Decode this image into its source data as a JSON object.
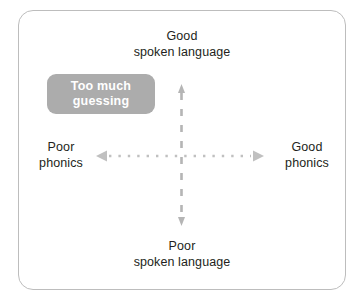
{
  "diagram": {
    "type": "quadrant-axes",
    "frame": {
      "border_color": "#bdbdbd",
      "background": "#ffffff",
      "corner_radius_px": 15
    },
    "axes": {
      "vertical": {
        "name": "spoken-language-axis",
        "top_label_line1": "Good",
        "top_label_line2": "spoken language",
        "bottom_label_line1": "Poor",
        "bottom_label_line2": "spoken language",
        "style": "dashed",
        "color": "#b5b5b5",
        "arrowheads": "both"
      },
      "horizontal": {
        "name": "phonics-axis",
        "left_label_line1": "Poor",
        "left_label_line2": "phonics",
        "right_label_line1": "Good",
        "right_label_line2": "phonics",
        "style": "dotted",
        "color": "#c0c0c0",
        "arrowheads": "both"
      }
    },
    "callouts": [
      {
        "name": "too-much-guessing",
        "line1": "Too much",
        "line2": "guessing",
        "quadrant": "upper-left",
        "background_color": "#acacac",
        "text_color": "#ffffff"
      }
    ],
    "label_text_color": "#231f20"
  }
}
